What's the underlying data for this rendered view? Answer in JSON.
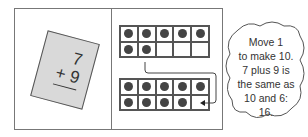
{
  "card": {
    "top_number": "7",
    "bottom_number": "+ 9"
  },
  "top_frame": {
    "cells": [
      1,
      1,
      1,
      1,
      1,
      1,
      1,
      0,
      0,
      0
    ]
  },
  "bottom_frame": {
    "cells": [
      1,
      1,
      1,
      1,
      1,
      1,
      1,
      1,
      1,
      0
    ]
  },
  "cloud": {
    "lines": [
      "Move 1",
      "to make 10.",
      "7 plus 9 is",
      "the same as",
      "10 and 6:",
      "16."
    ]
  }
}
